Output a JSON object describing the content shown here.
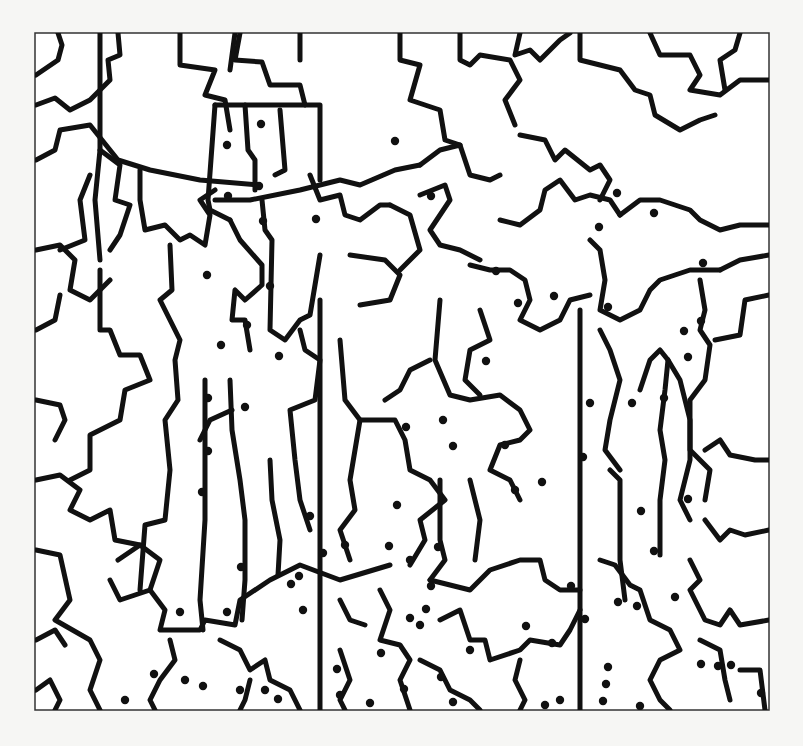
{
  "puzzle": {
    "title": "Dot-to-shade hidden picture puzzle",
    "top_text_fragment": "",
    "frame": {
      "x": 35,
      "y": 33,
      "width": 734,
      "height": 677
    },
    "colors": {
      "background": "#f6f6f4",
      "frame_fill": "#ffffff",
      "ink": "#111111",
      "frame_stroke": "#333333"
    },
    "lines": [
      "36,75 58,60 62,45 58,33",
      "100,33 100,150 95,200 100,260",
      "36,105 55,98 70,110 90,100 110,80 108,60 120,55 118,33",
      "36,160 55,150 60,130 90,125 110,150 118,160 150,170 200,180 260,185",
      "180,33 180,65 215,70 205,95 225,100 230,130",
      "240,33 235,60 262,62 270,85 300,85 305,105",
      "215,105 208,200 210,210 230,220",
      "215,105 320,105 320,180",
      "245,105 248,150 255,160 255,190",
      "280,110 285,170 275,175",
      "230,70 235,33",
      "300,60 300,33",
      "100,150 120,165 115,200 130,205 120,235 110,250",
      "36,250 60,245 75,260 70,290 90,300 110,280",
      "36,330 55,320 60,295",
      "36,400 60,405 65,420 55,440",
      "90,175 80,200 85,240 60,250",
      "140,170 140,200 145,230 165,225 180,240 190,235 205,245 210,215 200,200 215,190",
      "215,200 250,200 300,190 340,180 360,185 395,170 420,165",
      "230,220 240,240 262,265 262,285 245,300 235,290 232,320 245,320 250,350",
      "262,200 265,230 272,240 270,330 285,340 300,320 310,315 320,255",
      "310,175 320,200 340,195 345,215 360,220 380,205 390,205",
      "170,245 172,290 160,300 170,320 180,340 175,360 178,400 165,420 170,470 165,520 145,525 140,590",
      "100,270 100,330 110,330 120,355 140,355 150,380 125,390 120,420 90,435 90,470 70,480",
      "36,480 60,475 80,490 70,510 90,520 110,510 115,540 140,545",
      "36,550 60,555 70,600 55,620 90,640 100,660 90,690 100,710",
      "36,640 55,630 65,645",
      "118,560 140,545 160,560 150,590 120,600 110,580",
      "150,590 165,610 160,630 200,630 205,620 235,625 240,600 270,580 300,565 340,580 390,565",
      "205,380 205,520 200,600 203,630",
      "230,380 232,430 240,480 245,520 245,580 242,620",
      "232,410 210,420 200,440",
      "270,460 272,500 280,540 278,575",
      "300,330 305,350 320,360 315,400 290,410 295,460 300,500 310,530",
      "320,300 320,710",
      "340,340 345,400 360,420 350,480 355,510 340,530 350,560",
      "360,420 395,420 405,440 410,470 430,480 445,500 420,520 425,540 410,565",
      "350,255 385,260 400,275 390,300 360,305",
      "390,205 410,215 420,250 400,270",
      "420,165 440,150 460,145 470,175 490,180 500,175",
      "400,33 400,60 420,65 410,100 440,110 445,140 460,145",
      "460,33 460,60 470,65 480,55 510,60 520,80 505,100 515,125",
      "520,33 515,55 530,50 540,60 560,40 570,33",
      "580,33 580,60 620,70 635,90 650,95 655,115 680,130 700,120 715,115",
      "650,33 660,55 690,55 700,75 690,90 720,95 740,80 769,80",
      "740,33 735,50 720,60 725,90",
      "420,195 445,185 450,200 430,230 440,245 460,250 480,260",
      "440,300 435,360 450,395 470,400 500,395 520,410 530,430 520,440 500,445 490,470 510,480 520,500",
      "470,265 490,270 510,270 525,280 530,300 520,320 540,330 560,320 570,300 590,295",
      "430,360 410,370 400,390 385,400",
      "480,310 490,340 470,350 465,380 480,395",
      "500,220 520,225 540,210 545,190 560,180 575,200 590,195 610,200 620,215",
      "520,135 545,140 555,160 565,150 590,170 600,165 610,180 600,200",
      "620,215 640,200 660,200 690,210 700,220 720,230 740,225 769,225",
      "590,240 600,250 605,280 600,310 620,320 640,310 650,290 660,280 690,270 720,270",
      "580,310 580,710",
      "600,330 610,350 620,380 610,420 605,450 620,470",
      "610,470 620,480 620,560 625,600",
      "640,390 650,360 660,350 668,360 665,390 660,430 665,460 660,500 660,555",
      "668,360 680,380 690,420 690,460 680,500 690,520",
      "700,280 705,310 700,330 710,345 705,380 690,400 690,450 710,470 705,500",
      "720,270 740,260 769,255",
      "715,340 740,335 745,300 769,295",
      "705,450 720,440 730,455 755,460 769,460",
      "705,520 720,540 730,530 745,535 769,530",
      "430,580 470,590 490,570 520,560 540,560 545,580 560,590 580,590",
      "440,480 440,540 445,560 430,580",
      "470,480 480,520 475,560",
      "380,590 390,610 380,640 400,645 410,660 400,680 410,710",
      "340,600 350,620 365,625",
      "440,620 460,610 470,640 485,640 490,660 520,650 530,640 560,645 570,630 580,610",
      "520,660 515,680 525,700 520,710",
      "600,560 615,565 630,585 640,590 650,620 670,630 680,650 660,660 650,680 660,700 670,710",
      "690,560 700,580 690,590 705,620 720,625 730,610 740,625 769,620",
      "700,640 720,650 725,680 730,700",
      "740,670 760,670 765,710",
      "36,690 50,680 60,700 55,710",
      "170,640 175,660 160,680 150,700 155,710",
      "220,640 240,650 250,670 265,660 270,680 290,690 300,710",
      "250,680 245,700 240,710",
      "340,650 350,680 340,700 345,710",
      "420,660 440,670 450,690 470,700 480,710"
    ],
    "dots": [
      [
        261,
        124
      ],
      [
        227,
        145
      ],
      [
        259,
        186
      ],
      [
        228,
        196
      ],
      [
        263,
        221
      ],
      [
        316,
        219
      ],
      [
        207,
        275
      ],
      [
        270,
        286
      ],
      [
        247,
        325
      ],
      [
        221,
        345
      ],
      [
        279,
        356
      ],
      [
        395,
        141
      ],
      [
        431,
        196
      ],
      [
        496,
        271
      ],
      [
        518,
        303
      ],
      [
        599,
        227
      ],
      [
        617,
        193
      ],
      [
        654,
        213
      ],
      [
        703,
        263
      ],
      [
        701,
        321
      ],
      [
        684,
        331
      ],
      [
        608,
        307
      ],
      [
        554,
        296
      ],
      [
        486,
        361
      ],
      [
        443,
        420
      ],
      [
        453,
        446
      ],
      [
        505,
        445
      ],
      [
        542,
        482
      ],
      [
        515,
        490
      ],
      [
        583,
        457
      ],
      [
        590,
        403
      ],
      [
        632,
        403
      ],
      [
        688,
        357
      ],
      [
        664,
        398
      ],
      [
        688,
        499
      ],
      [
        641,
        511
      ],
      [
        654,
        551
      ],
      [
        675,
        597
      ],
      [
        618,
        602
      ],
      [
        571,
        586
      ],
      [
        585,
        619
      ],
      [
        637,
        606
      ],
      [
        608,
        667
      ],
      [
        701,
        664
      ],
      [
        731,
        665
      ],
      [
        778,
        623
      ],
      [
        761,
        693
      ],
      [
        406,
        427
      ],
      [
        208,
        398
      ],
      [
        245,
        407
      ],
      [
        208,
        451
      ],
      [
        202,
        492
      ],
      [
        241,
        567
      ],
      [
        291,
        584
      ],
      [
        180,
        612
      ],
      [
        227,
        612
      ],
      [
        310,
        516
      ],
      [
        323,
        553
      ],
      [
        299,
        576
      ],
      [
        345,
        545
      ],
      [
        397,
        505
      ],
      [
        389,
        546
      ],
      [
        438,
        547
      ],
      [
        410,
        560
      ],
      [
        431,
        586
      ],
      [
        426,
        609
      ],
      [
        410,
        618
      ],
      [
        381,
        653
      ],
      [
        303,
        610
      ],
      [
        337,
        669
      ],
      [
        370,
        703
      ],
      [
        404,
        689
      ],
      [
        340,
        695
      ],
      [
        265,
        690
      ],
      [
        278,
        699
      ],
      [
        154,
        674
      ],
      [
        185,
        680
      ],
      [
        125,
        700
      ],
      [
        203,
        686
      ],
      [
        240,
        690
      ],
      [
        420,
        625
      ],
      [
        470,
        650
      ],
      [
        526,
        626
      ],
      [
        552,
        643
      ],
      [
        441,
        677
      ],
      [
        453,
        702
      ],
      [
        470,
        720
      ],
      [
        545,
        705
      ],
      [
        560,
        700
      ],
      [
        606,
        684
      ],
      [
        640,
        706
      ],
      [
        603,
        701
      ],
      [
        718,
        666
      ]
    ]
  }
}
